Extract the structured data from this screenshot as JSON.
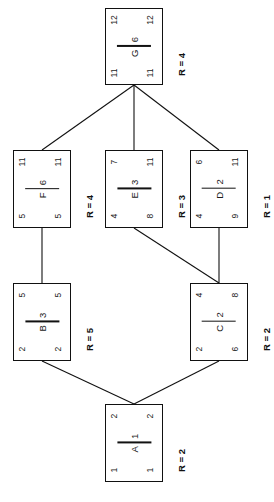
{
  "diagram": {
    "orientation": "rotated-90-ccw",
    "legend": {
      "corner_top_left": "early start",
      "corner_top_right": "early finish",
      "corner_bottom_left": "late start",
      "corner_bottom_right": "late finish",
      "center": "activity / duration",
      "side": "resource requirement"
    },
    "colors": {
      "background": "#ffffff",
      "stroke": "#111111",
      "text": "#1a1a1a"
    }
  },
  "nodes": [
    {
      "id": "G",
      "activity": "G",
      "duration": "6",
      "resource_label": "R = 4",
      "top_left": "12",
      "top_right": "12",
      "bottom_left": "11",
      "bottom_right": "11"
    },
    {
      "id": "F",
      "activity": "F",
      "duration": "6",
      "resource_label": "R = 4",
      "top_left": "11",
      "top_right": "11",
      "bottom_left": "5",
      "bottom_right": "5"
    },
    {
      "id": "E",
      "activity": "E",
      "duration": "3",
      "resource_label": "R = 3",
      "top_left": "7",
      "top_right": "11",
      "bottom_left": "4",
      "bottom_right": "8"
    },
    {
      "id": "D",
      "activity": "D",
      "duration": "2",
      "resource_label": "R = 1",
      "top_left": "6",
      "top_right": "11",
      "bottom_left": "4",
      "bottom_right": "9"
    },
    {
      "id": "B",
      "activity": "B",
      "duration": "3",
      "resource_label": "R = 5",
      "top_left": "5",
      "top_right": "5",
      "bottom_left": "2",
      "bottom_right": "2"
    },
    {
      "id": "C",
      "activity": "C",
      "duration": "2",
      "resource_label": "R = 2",
      "top_left": "4",
      "top_right": "8",
      "bottom_left": "2",
      "bottom_right": "6"
    },
    {
      "id": "A",
      "activity": "A",
      "duration": "1",
      "resource_label": "R = 2",
      "top_left": "2",
      "top_right": "2",
      "bottom_left": "1",
      "bottom_right": "1"
    }
  ],
  "edges": [
    {
      "from": "G",
      "to": "F"
    },
    {
      "from": "G",
      "to": "E"
    },
    {
      "from": "G",
      "to": "D"
    },
    {
      "from": "F",
      "to": "B"
    },
    {
      "from": "E",
      "to": "C"
    },
    {
      "from": "D",
      "to": "C"
    },
    {
      "from": "B",
      "to": "A"
    },
    {
      "from": "C",
      "to": "A"
    }
  ]
}
